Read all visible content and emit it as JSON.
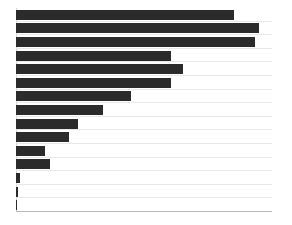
{
  "chart_data": {
    "type": "bar",
    "orientation": "horizontal",
    "title": "",
    "subtitle": "",
    "xlabel": "",
    "ylabel": "",
    "grid": true,
    "legend": false,
    "legend_position": "none",
    "bar_color": "#2b2b2b",
    "grid_color": "#e8e8e8",
    "axis_color": "#b8b8b8",
    "background_color": "#ffffff",
    "xlim": [
      0,
      100
    ],
    "categories": [
      "1",
      "2",
      "3",
      "4",
      "5",
      "6",
      "7",
      "8",
      "9",
      "10",
      "11",
      "12",
      "13",
      "14",
      "15"
    ],
    "values": [
      85.2,
      94.9,
      93.4,
      60.5,
      65.2,
      60.5,
      44.9,
      34.0,
      24.2,
      20.7,
      11.3,
      13.3,
      1.6,
      0.8,
      0.4
    ],
    "xticklabels": [],
    "yticklabels": [],
    "annotations": []
  },
  "figure": {
    "width_px": 292,
    "height_px": 225,
    "plot_left_px": 16,
    "plot_top_px": 8,
    "plot_width_px": 256,
    "plot_height_px": 204,
    "row_count": 15,
    "bar_thickness_ratio": 0.72
  }
}
